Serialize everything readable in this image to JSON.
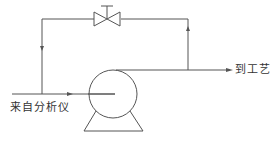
{
  "diagram": {
    "type": "process-flow",
    "labels": {
      "inlet": "来自分析仪",
      "outlet": "到工艺"
    },
    "components": [
      {
        "id": "pump",
        "kind": "centrifugal-pump"
      },
      {
        "id": "valve",
        "kind": "globe-valve",
        "location": "bypass-line-top"
      }
    ],
    "flows": [
      {
        "from": "inlet",
        "to": "pump",
        "direction": "right"
      },
      {
        "from": "inlet-branch",
        "to": "bypass",
        "direction": "up-left-line-arrow-down"
      },
      {
        "from": "pump-outlet",
        "to": "outlet",
        "direction": "right"
      },
      {
        "from": "outlet-branch",
        "to": "valve",
        "direction": "up"
      }
    ],
    "colors": {
      "line": "#555555",
      "text": "#333333",
      "background": "#ffffff"
    }
  }
}
